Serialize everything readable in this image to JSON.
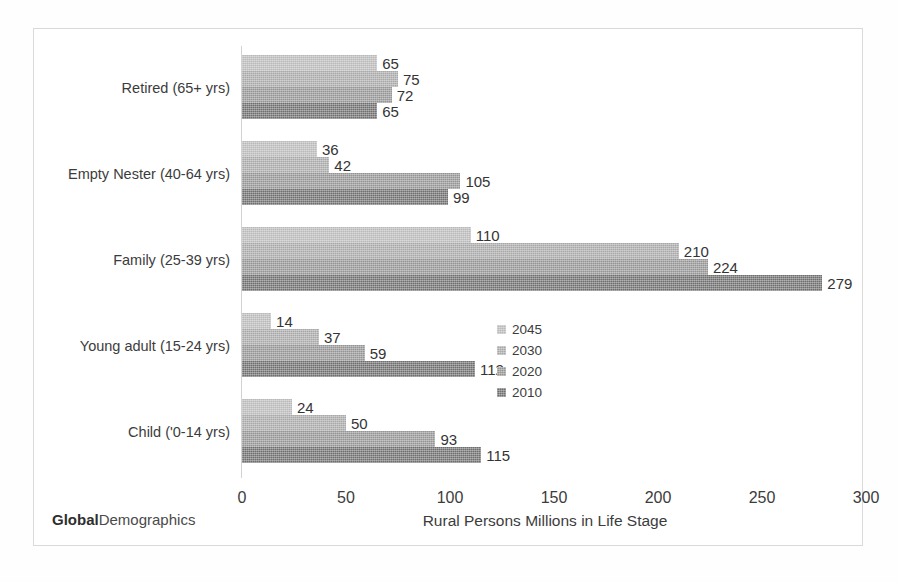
{
  "chart_data": {
    "type": "bar",
    "orientation": "horizontal",
    "title": "",
    "xlabel": "Rural Persons Millions in Life Stage",
    "ylabel": "",
    "xlim": [
      0,
      300
    ],
    "xticks": [
      "0",
      "50",
      "100",
      "150",
      "200",
      "250",
      "300"
    ],
    "grid": false,
    "legend_position": "inside-right",
    "categories": [
      "Retired (65+ yrs)",
      "Empty Nester (40-64 yrs)",
      "Family (25-39 yrs)",
      "Young adult (15-24 yrs)",
      "Child ('0-14 yrs)"
    ],
    "series": [
      {
        "name": "2045",
        "color": "#b9b9b9",
        "values": [
          65,
          36,
          110,
          14,
          24
        ]
      },
      {
        "name": "2030",
        "color": "#a8a8a8",
        "values": [
          75,
          42,
          210,
          37,
          50
        ]
      },
      {
        "name": "2020",
        "color": "#949494",
        "values": [
          72,
          105,
          224,
          59,
          93
        ]
      },
      {
        "name": "2010",
        "color": "#6e6e6e",
        "values": [
          65,
          99,
          279,
          112,
          115
        ]
      }
    ]
  },
  "legend": {
    "items": [
      {
        "label": "2045"
      },
      {
        "label": "2030"
      },
      {
        "label": "2020"
      },
      {
        "label": "2010"
      }
    ]
  },
  "footer": {
    "brand_bold": "Global",
    "brand_rest": "Demographics",
    "axis_title": "Rural Persons Millions in Life Stage"
  }
}
